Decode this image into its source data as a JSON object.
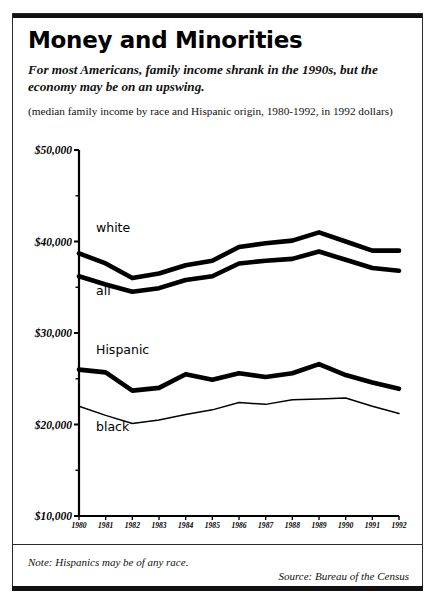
{
  "headline": "Money and Minorities",
  "deck": "For most Americans, family income shrank in the 1990s, but the economy may be on an upswing.",
  "subhead": "(median family income by race and Hispanic origin, 1980-1992, in 1992 dollars)",
  "note": "Note: Hispanics may be of any race.",
  "source": "Source: Bureau of the Census",
  "series_labels": {
    "white": "white",
    "all": "all",
    "hispanic": "Hispanic",
    "black": "black"
  },
  "colors": {
    "ink": "#000000",
    "paper": "#ffffff",
    "rule": "#111111"
  },
  "chart_data": {
    "type": "line",
    "title": "Money and Minorities",
    "subtitle": "For most Americans, family income shrank in the 1990s, but the economy may be on an upswing.",
    "caption": "(median family income by race and Hispanic origin, 1980-1992, in 1992 dollars)",
    "xlabel": "",
    "ylabel": "",
    "x": [
      1980,
      1981,
      1982,
      1983,
      1984,
      1985,
      1986,
      1987,
      1988,
      1989,
      1990,
      1991,
      1992
    ],
    "xticklabels": [
      "1980",
      "1981",
      "1982",
      "1983",
      "1984",
      "1985",
      "1986",
      "1987",
      "1988",
      "1989",
      "1990",
      "1991",
      "1992"
    ],
    "xlim": [
      1980,
      1992
    ],
    "ylim": [
      10000,
      50000
    ],
    "yticks": [
      10000,
      20000,
      30000,
      40000,
      50000
    ],
    "yticklabels": [
      "$10,000",
      "$20,000",
      "$30,000",
      "$40,000",
      "$50,000"
    ],
    "yminorticks": [
      15000,
      25000,
      35000,
      45000
    ],
    "grid": false,
    "legend": "inline-labels",
    "series": [
      {
        "name": "white",
        "linewidth": "thick",
        "values": [
          38700,
          37600,
          36000,
          36500,
          37400,
          37900,
          39400,
          39800,
          40100,
          41000,
          40000,
          39000,
          39000
        ]
      },
      {
        "name": "all",
        "linewidth": "thick",
        "values": [
          36200,
          35300,
          34500,
          34900,
          35800,
          36200,
          37600,
          37900,
          38100,
          38900,
          38000,
          37100,
          36800
        ]
      },
      {
        "name": "Hispanic",
        "linewidth": "thick",
        "values": [
          26000,
          25700,
          23700,
          24000,
          25500,
          24900,
          25600,
          25200,
          25600,
          26600,
          25400,
          24600,
          23900
        ]
      },
      {
        "name": "black",
        "linewidth": "thin",
        "values": [
          22000,
          21000,
          20100,
          20500,
          21100,
          21600,
          22400,
          22200,
          22700,
          22800,
          22900,
          22000,
          21200
        ]
      }
    ],
    "annotations": [
      {
        "text": "white",
        "series": "white"
      },
      {
        "text": "all",
        "series": "all"
      },
      {
        "text": "Hispanic",
        "series": "Hispanic"
      },
      {
        "text": "black",
        "series": "black"
      }
    ]
  }
}
